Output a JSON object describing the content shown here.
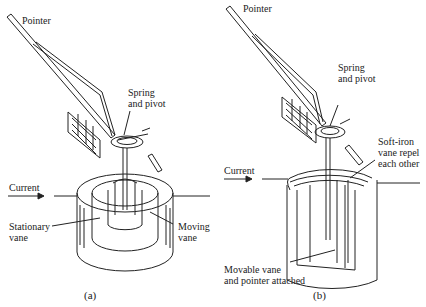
{
  "panel_a": {
    "pointer": "Pointer",
    "spring_pivot_1": "Spring",
    "spring_pivot_2": "and pivot",
    "current": "Current",
    "stationary_1": "Stationary",
    "stationary_2": "vane",
    "moving_1": "Moving",
    "moving_2": "vane",
    "caption": "(a)"
  },
  "panel_b": {
    "pointer": "Pointer",
    "spring_pivot_1": "Spring",
    "spring_pivot_2": "and pivot",
    "current": "Current",
    "softiron_1": "Soft-iron",
    "softiron_2": "vane repel",
    "softiron_3": "each other",
    "movable_1": "Movable vane",
    "movable_2": "and pointer attached",
    "caption": "(b)"
  },
  "colors": {
    "line": "#222222",
    "background": "#ffffff"
  }
}
